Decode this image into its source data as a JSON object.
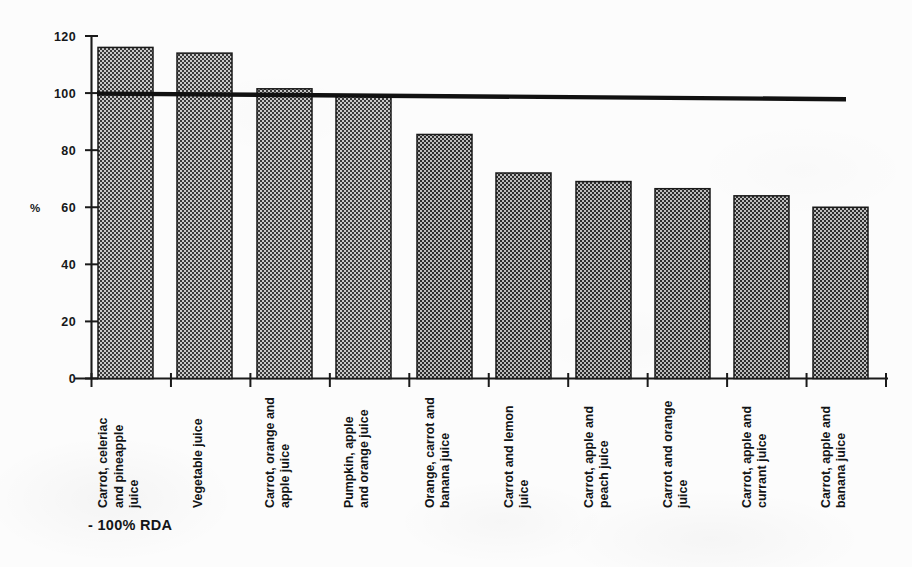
{
  "chart_data": {
    "type": "bar",
    "title": "",
    "subtitle": "",
    "xlabel": "",
    "ylabel": "%",
    "ylim": [
      0,
      120
    ],
    "yticks": [
      0,
      20,
      40,
      60,
      80,
      100,
      120
    ],
    "ytick_labels": [
      "0",
      "20",
      "40",
      "60",
      "80",
      "100",
      "120"
    ],
    "grid": false,
    "legend_position": "bottom-left",
    "categories": [
      "Carrot, celeriac and pineapple juice",
      "Vegetable juice",
      "Carrot, orange and apple juice",
      "Pumpkin, apple and orange juice",
      "Orange, carrot and banana juice",
      "Carrot and lemon juice",
      "Carrot, apple and peach juice",
      "Carrot and orange juice",
      "Carrot, apple and currant juice",
      "Carrot, apple and banana juice"
    ],
    "category_lines": [
      [
        "Carrot, celeriac",
        "and pineapple",
        "juice"
      ],
      [
        "Vegetable juice"
      ],
      [
        "Carrot, orange and",
        "apple juice"
      ],
      [
        "Pumpkin, apple",
        "and orange juice"
      ],
      [
        "Orange, carrot and",
        "banana juice"
      ],
      [
        "Carrot and lemon",
        "juice"
      ],
      [
        "Carrot, apple and",
        "peach juice"
      ],
      [
        "Carrot and orange",
        "juice"
      ],
      [
        "Carrot, apple and",
        "currant juice"
      ],
      [
        "Carrot, apple and",
        "banana juice"
      ]
    ],
    "values": [
      116,
      114,
      101.5,
      99,
      85.5,
      72,
      69,
      66.5,
      64,
      60
    ],
    "series": [
      {
        "name": "% RDA",
        "values": [
          116,
          114,
          101.5,
          99,
          85.5,
          72,
          69,
          66.5,
          64,
          60
        ]
      }
    ],
    "reference_line": {
      "label": "- 100% RDA",
      "value": 100,
      "style": "solid-thick-black"
    },
    "colors": {
      "bar_fill": "#8a8a8a",
      "bar_edge": "#1a1a1a",
      "axis": "#1a1a1a",
      "reference_line": "#111111",
      "text": "#141414",
      "background": "#fcfcfc"
    }
  },
  "legend": {
    "entries": [
      {
        "label": "- 100% RDA",
        "marker": "line"
      }
    ]
  },
  "axis": {
    "y_title": "%",
    "y_tick_labels": [
      "120",
      "100",
      "80",
      "60",
      "40",
      "20",
      "0"
    ]
  }
}
